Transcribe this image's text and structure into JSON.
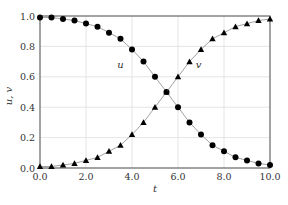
{
  "chart_data": {
    "type": "line",
    "title": "",
    "xlabel": "t",
    "ylabel": "u, v",
    "xlim": [
      0,
      10
    ],
    "ylim": [
      0,
      1
    ],
    "grid": true,
    "legend": "none (inline labels)",
    "x_ticks": [
      "0.0",
      "2.0",
      "4.0",
      "6.0",
      "8.0",
      "10.0"
    ],
    "y_ticks": [
      "0.0",
      "0.2",
      "0.4",
      "0.6",
      "0.8",
      "1.0"
    ],
    "annotations": [
      {
        "text": "u",
        "x": 3.5,
        "y": 0.66
      },
      {
        "text": "v",
        "x": 6.9,
        "y": 0.66
      }
    ],
    "x": [
      0,
      0.5,
      1,
      1.5,
      2,
      2.5,
      3,
      3.5,
      4,
      4.5,
      5,
      5.5,
      6,
      6.5,
      7,
      7.5,
      8,
      8.5,
      9,
      9.5,
      10
    ],
    "series": [
      {
        "name": "u",
        "marker": "circle",
        "values": [
          0.99,
          0.99,
          0.98,
          0.97,
          0.95,
          0.93,
          0.89,
          0.85,
          0.78,
          0.7,
          0.6,
          0.5,
          0.4,
          0.3,
          0.22,
          0.15,
          0.11,
          0.07,
          0.05,
          0.03,
          0.02
        ]
      },
      {
        "name": "v",
        "marker": "triangle",
        "values": [
          0.01,
          0.01,
          0.02,
          0.03,
          0.05,
          0.07,
          0.11,
          0.15,
          0.22,
          0.3,
          0.4,
          0.5,
          0.6,
          0.7,
          0.78,
          0.85,
          0.89,
          0.93,
          0.95,
          0.97,
          0.98
        ]
      }
    ]
  }
}
